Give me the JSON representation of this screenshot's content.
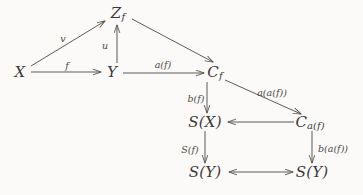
{
  "diagram": {
    "background_color": "#fbfaf8",
    "stroke_color": "#55534f",
    "text_color": "#3b3a38",
    "nodes": [
      {
        "id": "X",
        "label": "X",
        "sub": "",
        "x": 20,
        "y": 72
      },
      {
        "id": "Zf",
        "label": "Z",
        "sub": "f",
        "x": 118,
        "y": 13
      },
      {
        "id": "Y",
        "label": "Y",
        "sub": "",
        "x": 112,
        "y": 72
      },
      {
        "id": "Cf",
        "label": "C",
        "sub": "f",
        "x": 215,
        "y": 72
      },
      {
        "id": "SX",
        "label": "S(X)",
        "sub": "",
        "x": 205,
        "y": 122
      },
      {
        "id": "Caf",
        "label": "C",
        "sub": "a(f)",
        "x": 310,
        "y": 122
      },
      {
        "id": "SY1",
        "label": "S(Y)",
        "sub": "",
        "x": 205,
        "y": 172
      },
      {
        "id": "SY2",
        "label": "S(Y)",
        "sub": "",
        "x": 312,
        "y": 172
      }
    ],
    "edges": [
      {
        "id": "X-Zf",
        "from": "X",
        "to": "Zf",
        "label": "v",
        "label_x": 63,
        "label_y": 38,
        "arrowheads": "end"
      },
      {
        "id": "X-Y",
        "from": "X",
        "to": "Y",
        "label": "f",
        "label_x": 67,
        "label_y": 65,
        "arrowheads": "end"
      },
      {
        "id": "Y-Zf",
        "from": "Y",
        "to": "Zf",
        "label": "u",
        "label_x": 105,
        "label_y": 45,
        "arrowheads": "end"
      },
      {
        "id": "Y-Cf",
        "from": "Y",
        "to": "Cf",
        "label": "a(f)",
        "label_x": 163,
        "label_y": 64,
        "arrowheads": "end"
      },
      {
        "id": "Zf-Cf",
        "from": "Zf",
        "to": "Cf",
        "label": "",
        "label_x": 0,
        "label_y": 0,
        "arrowheads": "end"
      },
      {
        "id": "Cf-SX",
        "from": "Cf",
        "to": "SX",
        "label": "b(f)",
        "label_x": 196,
        "label_y": 98,
        "arrowheads": "end"
      },
      {
        "id": "Cf-Caf",
        "from": "Cf",
        "to": "Caf",
        "label": "a(a(f))",
        "label_x": 272,
        "label_y": 92,
        "arrowheads": "end"
      },
      {
        "id": "Caf-SX",
        "from": "Caf",
        "to": "SX",
        "label": "",
        "label_x": 0,
        "label_y": 0,
        "arrowheads": "end"
      },
      {
        "id": "SX-SY1",
        "from": "SX",
        "to": "SY1",
        "label": "S(f)",
        "label_x": 190,
        "label_y": 149,
        "arrowheads": "end"
      },
      {
        "id": "Caf-SY2",
        "from": "Caf",
        "to": "SY2",
        "label": "b(a(f))",
        "label_x": 333,
        "label_y": 148,
        "arrowheads": "end"
      },
      {
        "id": "SY1-SY2",
        "from": "SY1",
        "to": "SY2",
        "label": "",
        "label_x": 0,
        "label_y": 0,
        "arrowheads": "both"
      }
    ]
  }
}
